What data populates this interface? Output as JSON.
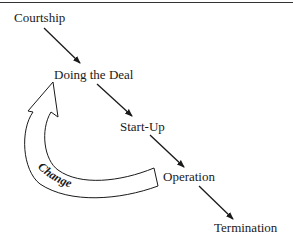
{
  "diagram": {
    "type": "lifecycle-flow",
    "stages": [
      {
        "label": "Courtship"
      },
      {
        "label": "Doing the Deal"
      },
      {
        "label": "Start-Up"
      },
      {
        "label": "Operation"
      },
      {
        "label": "Termination"
      }
    ],
    "feedback_arrow": {
      "label": "Change",
      "from": "Operation",
      "to": "Doing the Deal"
    },
    "colors": {
      "text": "#1a1a1a",
      "arrow": "#1a1a1a",
      "rule": "#333333",
      "background": "#ffffff"
    }
  }
}
